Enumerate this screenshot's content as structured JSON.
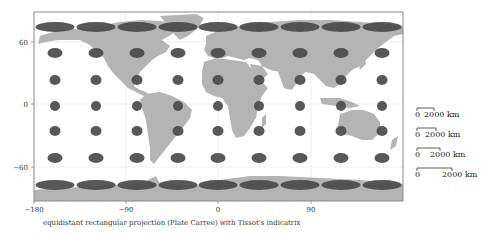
{
  "figure": {
    "caption": "equidistant rectangular projection (Plate Carree) with Tissot's indicatrix",
    "projection": "Plate Carree",
    "colors": {
      "land": "#b4b4b4",
      "ellipse": "#4a4a4a",
      "frame": "#888888",
      "grid": "#d8d8d8",
      "background": "#ffffff"
    }
  },
  "axes": {
    "x_ticks": [
      {
        "value": -180,
        "label": "−180"
      },
      {
        "value": -90,
        "label": "−90"
      },
      {
        "value": 0,
        "label": "0"
      },
      {
        "value": 90,
        "label": "90"
      }
    ],
    "y_ticks": [
      {
        "value": 60,
        "label": "60"
      },
      {
        "value": 0,
        "label": "0"
      },
      {
        "value": -60,
        "label": "−60"
      }
    ],
    "xlim": [
      -180,
      180
    ],
    "ylim": [
      -90,
      90
    ]
  },
  "tissot": {
    "longitudes": [
      -160,
      -120,
      -80,
      -40,
      0,
      40,
      80,
      120,
      160
    ],
    "latitudes": [
      75,
      50,
      25,
      0,
      -25,
      -50,
      -75
    ],
    "radius_km": 500
  },
  "scale_bars": [
    {
      "left_label": "0",
      "right_label": "2000 km",
      "bar_px": 17
    },
    {
      "left_label": "0",
      "right_label": "2000 km",
      "bar_px": 19
    },
    {
      "left_label": "0",
      "right_label": "2000 km",
      "bar_px": 23
    },
    {
      "left_label": "0",
      "right_label": "2000 km",
      "bar_px": 35
    }
  ]
}
